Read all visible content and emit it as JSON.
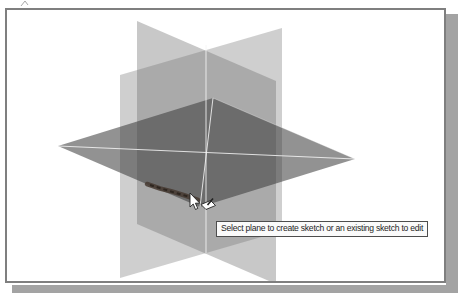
{
  "window": {
    "tooltip_text": "Select plane to create sketch or an existing sketch to edit"
  },
  "cursor": {
    "icon": "arrow-cursor-with-create-sketch-badge"
  },
  "scene": {
    "description_visible_elements": "three origin planes, horizontal plane highlighted under cursor",
    "highlighted_edge": "lower-left edge of horizontal plane"
  },
  "colors": {
    "canvas_bg": "#ffffff",
    "frame_border": "#7f7f7f",
    "drop_shadow": "#a3a3a3",
    "vertical_plane_right": "rgba(110,110,110,0.33)",
    "vertical_plane_left": "rgba(110,110,110,0.38)",
    "highlighted_plane": "rgba(56,56,56,0.55)",
    "axis_line": "rgba(244,244,244,0.85)",
    "edge_top_sheen": "rgba(255,255,255,0.30)",
    "edge_highlight": "#473a31",
    "edge_highlight_dark": "#2e2620",
    "cursor_fill": "#ffffff",
    "cursor_outline": "#222222",
    "stray_mark": "#a8a8a8",
    "tooltip_bg": "#fafafa",
    "tooltip_border": "#4d4d4d",
    "tooltip_text_color": "#1f1f1f"
  }
}
